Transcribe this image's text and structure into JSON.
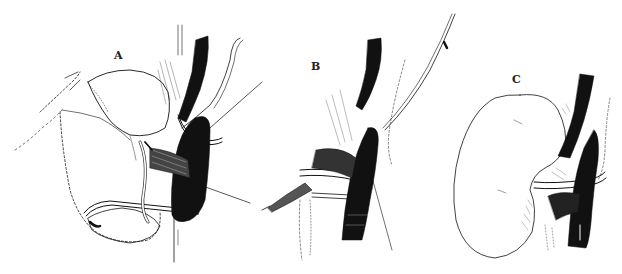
{
  "figure": {
    "panels": [
      {
        "id": "A",
        "label": "A"
      },
      {
        "id": "B",
        "label": "B"
      },
      {
        "id": "C",
        "label": "C"
      }
    ],
    "colors": {
      "ink": "#111111",
      "background": "#ffffff",
      "shading": "#555555"
    }
  }
}
